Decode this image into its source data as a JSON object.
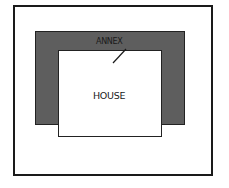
{
  "diagram": {
    "labels": {
      "annex": "ANNEX",
      "house": "HOUSE"
    },
    "colors": {
      "annex_fill": "#5e5e5e",
      "house_fill": "#ffffff",
      "outline": "#1a1a1a"
    }
  }
}
